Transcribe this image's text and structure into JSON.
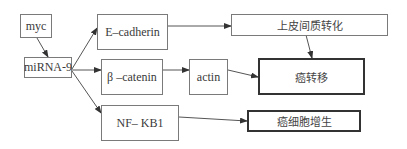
{
  "diagram": {
    "nodes": [
      {
        "id": "myc",
        "label": "myc"
      },
      {
        "id": "mirna9",
        "label": "miRNA-9"
      },
      {
        "id": "ecadherin",
        "label": "E–cadherin"
      },
      {
        "id": "bcatenin",
        "label": "β –catenin"
      },
      {
        "id": "actin",
        "label": "actin"
      },
      {
        "id": "nfkb1",
        "label": "NF– KB1"
      },
      {
        "id": "emt",
        "label": "上皮间质转化"
      },
      {
        "id": "metastasis",
        "label": "癌转移"
      },
      {
        "id": "proliferation",
        "label": "癌细胞增生"
      }
    ],
    "edges": [
      {
        "from": "myc",
        "to": "mirna9"
      },
      {
        "from": "mirna9",
        "to": "ecadherin"
      },
      {
        "from": "mirna9",
        "to": "bcatenin"
      },
      {
        "from": "mirna9",
        "to": "nfkb1"
      },
      {
        "from": "ecadherin",
        "to": "emt"
      },
      {
        "from": "bcatenin",
        "to": "actin"
      },
      {
        "from": "actin",
        "to": "metastasis"
      },
      {
        "from": "emt",
        "to": "metastasis"
      },
      {
        "from": "nfkb1",
        "to": "proliferation"
      }
    ],
    "colors": {
      "line": "#555555",
      "border": "#7a7a7a",
      "thick_border": "#333333"
    }
  }
}
